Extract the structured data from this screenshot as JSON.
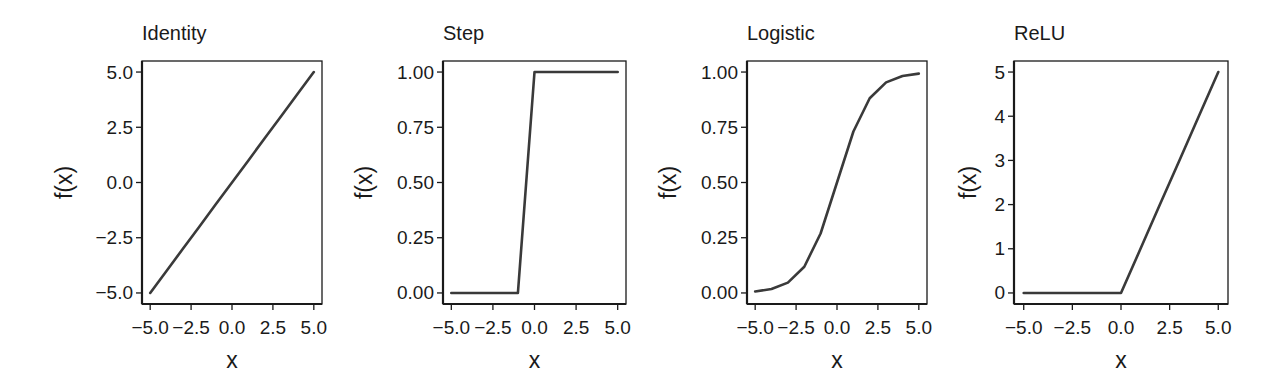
{
  "figure": {
    "width": 1277,
    "height": 392,
    "line_color": "#3a3a3a",
    "axis_color": "#1a1a1a",
    "background": "#ffffff"
  },
  "chart_data": [
    {
      "type": "line",
      "title": "Identity",
      "xlabel": "x",
      "ylabel": "f(x)",
      "x": [
        -5,
        -4,
        -3,
        -2,
        -1,
        0,
        1,
        2,
        3,
        4,
        5
      ],
      "series": [
        {
          "name": "Identity",
          "values": [
            -5,
            -4,
            -3,
            -2,
            -1,
            0,
            1,
            2,
            3,
            4,
            5
          ]
        }
      ],
      "xlim": [
        -5.5,
        5.5
      ],
      "ylim": [
        -5.5,
        5.5
      ],
      "xticks": [
        -5.0,
        -2.5,
        0.0,
        2.5,
        5.0
      ],
      "xtick_labels": [
        "−5.0",
        "−2.5",
        "0.0",
        "2.5",
        "5.0"
      ],
      "yticks": [
        -5.0,
        -2.5,
        0.0,
        2.5,
        5.0
      ],
      "ytick_labels": [
        "−5.0",
        "−2.5",
        "0.0",
        "2.5",
        "5.0"
      ],
      "grid": false,
      "legend": null,
      "layout": {
        "box": [
          142,
          61,
          322,
          304
        ],
        "title_x": 142,
        "ylabel_x": 64
      }
    },
    {
      "type": "line",
      "title": "Step",
      "xlabel": "x",
      "ylabel": "f(x)",
      "x": [
        -5,
        -4,
        -3,
        -2,
        -1,
        0,
        1,
        2,
        3,
        4,
        5
      ],
      "series": [
        {
          "name": "Step",
          "values": [
            0,
            0,
            0,
            0,
            0,
            1,
            1,
            1,
            1,
            1,
            1
          ]
        }
      ],
      "xlim": [
        -5.5,
        5.5
      ],
      "ylim": [
        -0.05,
        1.05
      ],
      "xticks": [
        -5.0,
        -2.5,
        0.0,
        2.5,
        5.0
      ],
      "xtick_labels": [
        "−5.0",
        "−2.5",
        "0.0",
        "2.5",
        "5.0"
      ],
      "yticks": [
        0.0,
        0.25,
        0.5,
        0.75,
        1.0
      ],
      "ytick_labels": [
        "0.00",
        "0.25",
        "0.50",
        "0.75",
        "1.00"
      ],
      "grid": false,
      "legend": null,
      "layout": {
        "box": [
          443,
          61,
          626,
          304
        ],
        "title_x": 443,
        "ylabel_x": 364
      }
    },
    {
      "type": "line",
      "title": "Logistic",
      "xlabel": "x",
      "ylabel": "f(x)",
      "x": [
        -5,
        -4,
        -3,
        -2,
        -1,
        0,
        1,
        2,
        3,
        4,
        5
      ],
      "series": [
        {
          "name": "Logistic",
          "values": [
            0.0067,
            0.018,
            0.047,
            0.119,
            0.269,
            0.5,
            0.731,
            0.881,
            0.953,
            0.982,
            0.993
          ]
        }
      ],
      "xlim": [
        -5.5,
        5.5
      ],
      "ylim": [
        -0.05,
        1.05
      ],
      "xticks": [
        -5.0,
        -2.5,
        0.0,
        2.5,
        5.0
      ],
      "xtick_labels": [
        "−5.0",
        "−2.5",
        "0.0",
        "2.5",
        "5.0"
      ],
      "yticks": [
        0.0,
        0.25,
        0.5,
        0.75,
        1.0
      ],
      "ytick_labels": [
        "0.00",
        "0.25",
        "0.50",
        "0.75",
        "1.00"
      ],
      "grid": false,
      "legend": null,
      "layout": {
        "box": [
          747,
          61,
          927,
          304
        ],
        "title_x": 747,
        "ylabel_x": 668
      }
    },
    {
      "type": "line",
      "title": "ReLU",
      "xlabel": "x",
      "ylabel": "f(x)",
      "x": [
        -5,
        -4,
        -3,
        -2,
        -1,
        0,
        1,
        2,
        3,
        4,
        5
      ],
      "series": [
        {
          "name": "ReLU",
          "values": [
            0,
            0,
            0,
            0,
            0,
            0,
            1,
            2,
            3,
            4,
            5
          ]
        }
      ],
      "xlim": [
        -5.5,
        5.5
      ],
      "ylim": [
        -0.25,
        5.25
      ],
      "xticks": [
        -5.0,
        -2.5,
        0.0,
        2.5,
        5.0
      ],
      "xtick_labels": [
        "−5.0",
        "−2.5",
        "0.0",
        "2.5",
        "5.0"
      ],
      "yticks": [
        0,
        1,
        2,
        3,
        4,
        5
      ],
      "ytick_labels": [
        "0",
        "1",
        "2",
        "3",
        "4",
        "5"
      ],
      "grid": false,
      "legend": null,
      "layout": {
        "box": [
          1014,
          61,
          1228,
          304
        ],
        "title_x": 1014,
        "ylabel_x": 968
      }
    }
  ]
}
